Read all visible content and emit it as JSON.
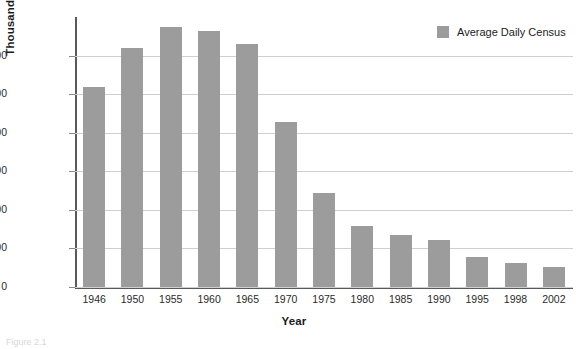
{
  "chart_data": {
    "type": "bar",
    "title": "",
    "xlabel": "Year",
    "ylabel": "Thousands of Patients",
    "categories": [
      "1946",
      "1950",
      "1955",
      "1960",
      "1965",
      "1970",
      "1975",
      "1980",
      "1985",
      "1990",
      "1995",
      "1998",
      "2002"
    ],
    "values": [
      518,
      620,
      675,
      663,
      629,
      428,
      243,
      157,
      136,
      122,
      79,
      63,
      53
    ],
    "series": [
      {
        "name": "Average Daily Census",
        "color": "#9c9c9c",
        "values": [
          518,
          620,
          675,
          663,
          629,
          428,
          243,
          157,
          136,
          122,
          79,
          63,
          53
        ]
      }
    ],
    "ylim": [
      0,
      700
    ],
    "yticks": [
      0,
      100,
      200,
      300,
      400,
      500,
      600
    ],
    "ytick_labels": [
      "0",
      "100",
      "200",
      "300",
      "400",
      "500",
      "600"
    ],
    "grid": "horizontal",
    "legend_position": "top-right"
  },
  "legend": {
    "entries": [
      {
        "label": "Average Daily Census",
        "color": "#9c9c9c"
      }
    ]
  },
  "axes": {
    "y_title": "Thousands of Patients",
    "x_title": "Year"
  },
  "caption": {
    "text": "Figure 2.1"
  }
}
